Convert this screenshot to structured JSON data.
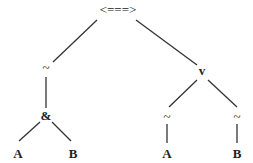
{
  "diagram": {
    "type": "parse-tree",
    "nodes": {
      "root": {
        "label": "<===>",
        "x": 118,
        "y": 14
      },
      "left_not": {
        "label": "~",
        "x": 46,
        "y": 72
      },
      "and": {
        "label": "&",
        "x": 46,
        "y": 120
      },
      "and_a": {
        "label": "A",
        "x": 18,
        "y": 158
      },
      "and_b": {
        "label": "B",
        "x": 73,
        "y": 158
      },
      "or": {
        "label": "v",
        "x": 202,
        "y": 75
      },
      "right_not_a": {
        "label": "~",
        "x": 167,
        "y": 121
      },
      "right_not_b": {
        "label": "~",
        "x": 237,
        "y": 121
      },
      "or_a": {
        "label": "A",
        "x": 167,
        "y": 158
      },
      "or_b": {
        "label": "B",
        "x": 237,
        "y": 158
      }
    },
    "edges": [
      {
        "from": "root",
        "to": "left_not"
      },
      {
        "from": "root",
        "to": "or"
      },
      {
        "from": "left_not",
        "to": "and"
      },
      {
        "from": "and",
        "to": "and_a"
      },
      {
        "from": "and",
        "to": "and_b"
      },
      {
        "from": "or",
        "to": "right_not_a"
      },
      {
        "from": "or",
        "to": "right_not_b"
      },
      {
        "from": "right_not_a",
        "to": "or_a"
      },
      {
        "from": "right_not_b",
        "to": "or_b"
      }
    ]
  }
}
